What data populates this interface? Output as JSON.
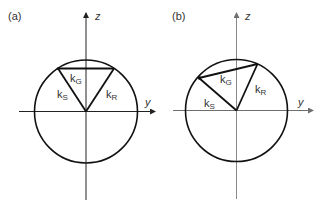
{
  "figure": {
    "panels": [
      {
        "id": "a",
        "label": "(a)",
        "axis_color": "#222222",
        "axes": {
          "horizontal_label": "y",
          "vertical_label": "z"
        },
        "vectors": {
          "k_S": {
            "base": "k",
            "sub": "S"
          },
          "k_G": {
            "base": "k",
            "sub": "G"
          },
          "k_R": {
            "base": "k",
            "sub": "R"
          }
        },
        "description": "Ewald sphere with symmetric triangle; k_G horizontal"
      },
      {
        "id": "b",
        "label": "(b)",
        "axis_color": "#8a8a8a",
        "axes": {
          "horizontal_label": "y",
          "vertical_label": "z"
        },
        "vectors": {
          "k_S": {
            "base": "k",
            "sub": "S"
          },
          "k_G": {
            "base": "k",
            "sub": "G"
          },
          "k_R": {
            "base": "k",
            "sub": "R"
          }
        },
        "description": "Ewald sphere with tilted triangle; k_G inclined"
      }
    ],
    "colors": {
      "stroke": "#111111",
      "text": "#333333"
    }
  }
}
